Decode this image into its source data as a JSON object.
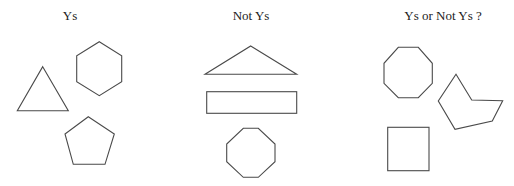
{
  "panels": [
    {
      "title": "Ys",
      "shapes": [
        "triangle",
        "hexagon",
        "pentagon"
      ]
    },
    {
      "title": "Not Ys",
      "shapes": [
        "flat-triangle",
        "rectangle",
        "octagon"
      ]
    },
    {
      "title": "Ys or Not Ys ?",
      "shapes": [
        "octagon",
        "concave-pentagon",
        "square"
      ]
    }
  ],
  "colors": {
    "stroke": "#4a4a4a",
    "background": "#ffffff",
    "text": "#222222"
  }
}
